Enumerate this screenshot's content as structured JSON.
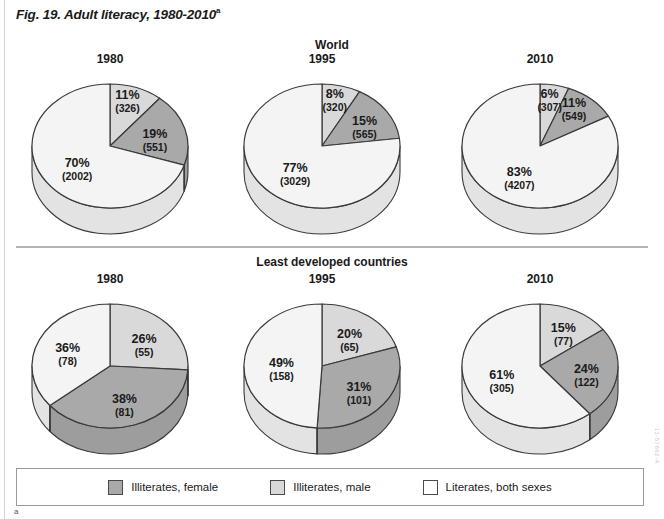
{
  "figure": {
    "title": "Fig. 19. Adult literacy, 1980-2010",
    "title_superscript": "a",
    "footnote_marker": "a",
    "side_code": "11-57862-A"
  },
  "sections": [
    {
      "id": "world",
      "heading": "World"
    },
    {
      "id": "ldc",
      "heading": "Least developed countries"
    }
  ],
  "legend": {
    "items": [
      {
        "label": "Illiterates, female",
        "color": "#a9a9a9"
      },
      {
        "label": "Illiterates, male",
        "color": "#d9d9d9"
      },
      {
        "label": "Literates, both sexes",
        "color": "#f4f4f4"
      }
    ]
  },
  "colors": {
    "illiterates_female": "#a9a9a9",
    "illiterates_male": "#d9d9d9",
    "literates_both": "#f4f4f4",
    "outline": "#3a3a3a",
    "text": "#1a1a1a"
  },
  "chart_data": {
    "type": "pie",
    "title": "Fig. 19. Adult literacy, 1980-2010",
    "note": "Six 3-D pie charts. Values in parentheses are counts in millions.",
    "legend_position": "bottom",
    "series_names": [
      "Illiterates, male",
      "Illiterates, female",
      "Literates, both sexes"
    ],
    "panels": [
      {
        "section": "World",
        "year": "1980",
        "slices": [
          {
            "name": "Illiterates, male",
            "percent": 11,
            "percent_label": "11%",
            "count": 326,
            "count_label": "(326)",
            "color": "#d9d9d9"
          },
          {
            "name": "Illiterates, female",
            "percent": 19,
            "percent_label": "19%",
            "count": 551,
            "count_label": "(551)",
            "color": "#a9a9a9"
          },
          {
            "name": "Literates, both sexes",
            "percent": 70,
            "percent_label": "70%",
            "count": 2002,
            "count_label": "(2002)",
            "color": "#f4f4f4"
          }
        ]
      },
      {
        "section": "World",
        "year": "1995",
        "slices": [
          {
            "name": "Illiterates, male",
            "percent": 8,
            "percent_label": "8%",
            "count": 320,
            "count_label": "(320)",
            "color": "#d9d9d9"
          },
          {
            "name": "Illiterates, female",
            "percent": 15,
            "percent_label": "15%",
            "count": 565,
            "count_label": "(565)",
            "color": "#a9a9a9"
          },
          {
            "name": "Literates, both sexes",
            "percent": 77,
            "percent_label": "77%",
            "count": 3029,
            "count_label": "(3029)",
            "color": "#f4f4f4"
          }
        ]
      },
      {
        "section": "World",
        "year": "2010",
        "slices": [
          {
            "name": "Illiterates, male",
            "percent": 6,
            "percent_label": "6%",
            "count": 307,
            "count_label": "(307)",
            "color": "#d9d9d9"
          },
          {
            "name": "Illiterates, female",
            "percent": 11,
            "percent_label": "11%",
            "count": 549,
            "count_label": "(549)",
            "color": "#a9a9a9"
          },
          {
            "name": "Literates, both sexes",
            "percent": 83,
            "percent_label": "83%",
            "count": 4207,
            "count_label": "(4207)",
            "color": "#f4f4f4"
          }
        ]
      },
      {
        "section": "Least developed countries",
        "year": "1980",
        "slices": [
          {
            "name": "Illiterates, male",
            "percent": 26,
            "percent_label": "26%",
            "count": 55,
            "count_label": "(55)",
            "color": "#d9d9d9"
          },
          {
            "name": "Illiterates, female",
            "percent": 38,
            "percent_label": "38%",
            "count": 81,
            "count_label": "(81)",
            "color": "#a9a9a9"
          },
          {
            "name": "Literates, both sexes",
            "percent": 36,
            "percent_label": "36%",
            "count": 78,
            "count_label": "(78)",
            "color": "#f4f4f4"
          }
        ]
      },
      {
        "section": "Least developed countries",
        "year": "1995",
        "slices": [
          {
            "name": "Illiterates, male",
            "percent": 20,
            "percent_label": "20%",
            "count": 65,
            "count_label": "(65)",
            "color": "#d9d9d9"
          },
          {
            "name": "Illiterates, female",
            "percent": 31,
            "percent_label": "31%",
            "count": 101,
            "count_label": "(101)",
            "color": "#a9a9a9"
          },
          {
            "name": "Literates, both sexes",
            "percent": 49,
            "percent_label": "49%",
            "count": 158,
            "count_label": "(158)",
            "color": "#f4f4f4"
          }
        ]
      },
      {
        "section": "Least developed countries",
        "year": "2010",
        "slices": [
          {
            "name": "Illiterates, male",
            "percent": 15,
            "percent_label": "15%",
            "count": 77,
            "count_label": "(77)",
            "color": "#d9d9d9"
          },
          {
            "name": "Illiterates, female",
            "percent": 24,
            "percent_label": "24%",
            "count": 122,
            "count_label": "(122)",
            "color": "#a9a9a9"
          },
          {
            "name": "Literates, both sexes",
            "percent": 61,
            "percent_label": "61%",
            "count": 305,
            "count_label": "(305)",
            "color": "#f4f4f4"
          }
        ]
      }
    ]
  }
}
